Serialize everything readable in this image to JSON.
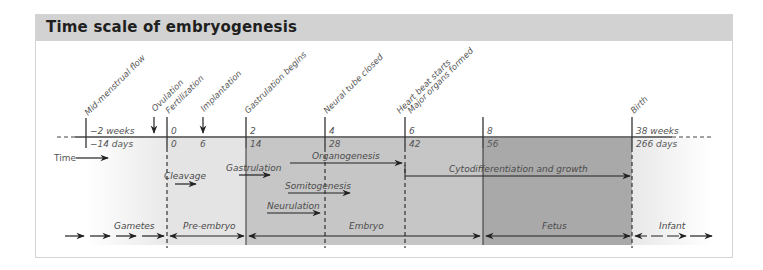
{
  "figure": {
    "title": "Time scale of embryogenesis"
  },
  "events": [
    {
      "id": "mid-menstrual-flow",
      "label": "Mid-menstrual flow",
      "marker": "line"
    },
    {
      "id": "ovulation",
      "label": "Ovulation",
      "marker": "arrow"
    },
    {
      "id": "fertilization",
      "label": "Fertilization",
      "marker": "line"
    },
    {
      "id": "implantation",
      "label": "Implantation",
      "marker": "arrow"
    },
    {
      "id": "gastrulation-begins",
      "label": "Gastrulation begins",
      "marker": "line"
    },
    {
      "id": "neural-tube-closed",
      "label": "Neural tube closed",
      "marker": "line"
    },
    {
      "id": "heart-beat-starts",
      "label": "Heart beat starts",
      "marker": "line"
    },
    {
      "id": "major-organs-formed",
      "label": "Major organs formed",
      "marker": "line"
    },
    {
      "id": "birth",
      "label": "Birth",
      "marker": "line"
    }
  ],
  "axis": {
    "weeks": [
      "−2 weeks",
      "0",
      "2",
      "4",
      "6",
      "8",
      "38 weeks"
    ],
    "days": [
      "−14 days",
      "0",
      "6",
      "14",
      "28",
      "42",
      "56",
      "266 days"
    ],
    "time_label": "Time"
  },
  "processes": [
    {
      "label": "Cleavage"
    },
    {
      "label": "Gastrulation"
    },
    {
      "label": "Organogenesis"
    },
    {
      "label": "Somitogenesis"
    },
    {
      "label": "Neurulation"
    },
    {
      "label": "Cytodifferentiation and growth"
    }
  ],
  "stages": [
    {
      "label": "Gametes"
    },
    {
      "label": "Pre-embryo"
    },
    {
      "label": "Embryo"
    },
    {
      "label": "Fetus"
    },
    {
      "label": "Infant"
    }
  ],
  "colors": {
    "title_bar": "#d2d2d2",
    "pre_embryo_region": "#e4e4e4",
    "embryo_region": "#c6c6c6",
    "fetus_region": "#a9a9a9",
    "line": "#333333",
    "text": "#555555"
  }
}
